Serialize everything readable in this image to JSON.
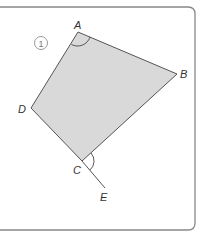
{
  "figure": {
    "number_label": "1",
    "shape": "quadrilateral",
    "fill_color": "#d9d9d9",
    "stroke_color": "#555555",
    "frame_color": "#888888",
    "vertices": {
      "A": {
        "label": "A",
        "x": 78,
        "y": 32
      },
      "B": {
        "label": "B",
        "x": 177,
        "y": 74
      },
      "C": {
        "label": "C",
        "x": 82,
        "y": 161
      },
      "D": {
        "label": "D",
        "x": 31,
        "y": 108
      },
      "E": {
        "label": "E",
        "x": 105,
        "y": 188
      }
    },
    "angle_marks": [
      "angle DAB at A",
      "exterior angle BCE at C"
    ],
    "extended_line": "DC extended to E"
  }
}
